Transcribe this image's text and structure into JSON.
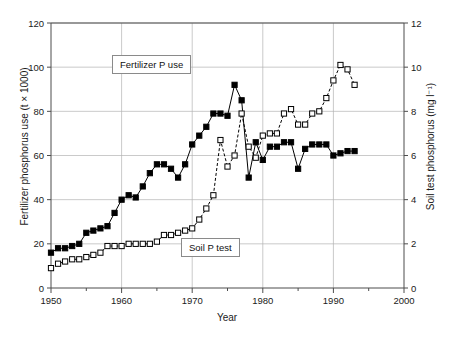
{
  "chart_data": {
    "type": "line",
    "title": "",
    "xlabel": "Year",
    "ylabel": "Fertilizer phosphorus use (t × 1000)",
    "ylabel_right": "Soil test phosphorus (mg l⁻¹)",
    "xlim": [
      1950,
      2000
    ],
    "ylim": [
      0,
      120
    ],
    "ylim_right": [
      0,
      12
    ],
    "xticks": [
      1950,
      1960,
      1970,
      1980,
      1990,
      2000
    ],
    "xticks_minor": [
      1955,
      1965,
      1975,
      1985,
      1995
    ],
    "yticks": [
      0,
      20,
      40,
      60,
      80,
      100,
      120
    ],
    "yticks_right": [
      0,
      2,
      4,
      6,
      8,
      10,
      12
    ],
    "grid": true,
    "legend_position": "inline-annotation",
    "annotations": [
      {
        "text": "Fertilizer P use",
        "series": "fertilizer-p-use"
      },
      {
        "text": "Soil P test",
        "series": "soil-p-test"
      }
    ],
    "series": [
      {
        "name": "Fertilizer P use",
        "axis": "left",
        "marker": "filled-square",
        "line": "solid",
        "color": "#000000",
        "x": [
          1950,
          1951,
          1952,
          1953,
          1954,
          1955,
          1956,
          1957,
          1958,
          1959,
          1960,
          1961,
          1962,
          1963,
          1964,
          1965,
          1966,
          1967,
          1968,
          1969,
          1970,
          1971,
          1972,
          1973,
          1974,
          1975,
          1976,
          1977,
          1978,
          1979,
          1980,
          1981,
          1982,
          1983,
          1984,
          1985,
          1986,
          1987,
          1988,
          1989,
          1990,
          1991,
          1992,
          1993
        ],
        "y": [
          16,
          18,
          18,
          19,
          20,
          25,
          26,
          27,
          28,
          34,
          40,
          42,
          41,
          46,
          52,
          56,
          56,
          54,
          50,
          56,
          65,
          69,
          73,
          79,
          79,
          78,
          92,
          85,
          50,
          66,
          58,
          64,
          64,
          66,
          66,
          54,
          63,
          65,
          65,
          65,
          60,
          61,
          62,
          62
        ]
      },
      {
        "name": "Soil P test",
        "axis": "right",
        "marker": "open-square",
        "line": "dashed",
        "color": "#000000",
        "x": [
          1950,
          1951,
          1952,
          1953,
          1954,
          1955,
          1956,
          1957,
          1958,
          1959,
          1960,
          1961,
          1962,
          1963,
          1964,
          1965,
          1966,
          1967,
          1968,
          1969,
          1970,
          1971,
          1972,
          1973,
          1974,
          1975,
          1976,
          1977,
          1978,
          1979,
          1980,
          1981,
          1982,
          1983,
          1984,
          1985,
          1986,
          1987,
          1988,
          1989,
          1990,
          1991,
          1992,
          1993
        ],
        "y": [
          0.9,
          1.1,
          1.2,
          1.3,
          1.3,
          1.4,
          1.5,
          1.6,
          1.9,
          1.9,
          1.9,
          2.0,
          2.0,
          2.0,
          2.0,
          2.1,
          2.4,
          2.4,
          2.5,
          2.6,
          2.7,
          3.1,
          3.6,
          4.2,
          6.7,
          5.5,
          6.0,
          7.9,
          6.4,
          5.9,
          6.9,
          7.0,
          7.0,
          7.9,
          8.1,
          7.4,
          7.4,
          7.9,
          8.0,
          8.6,
          9.4,
          10.1,
          9.9,
          9.2
        ]
      }
    ]
  },
  "axis_labels": {
    "x": "Year",
    "y_left": "Fertilizer phosphorus use (t × 1000)",
    "y_right": "Soil test phosphorus (mg l⁻¹)"
  },
  "annotations": {
    "fertilizer": "Fertilizer P use",
    "soil": "Soil P test"
  },
  "colors": {
    "axis": "#4d4d4d",
    "grid": "#b3b3b3",
    "series": "#000000",
    "background": "#ffffff"
  }
}
